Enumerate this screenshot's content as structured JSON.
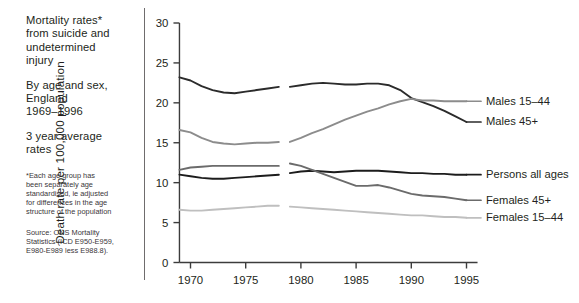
{
  "caption": {
    "title": "Mortality rates*\nfrom suicide and\nundetermined\ninjury",
    "subtitle": "By age and sex,\nEngland\n1969–1996",
    "subtitle2": "3 year average\nrates",
    "note": "*Each age group has\nbeen separately age\nstandardised, ie adjusted\nfor differences in the age\nstructure of the population",
    "source": "Source: ONS Mortality\nStatistics (ICD E950-E959,\nE980-E989 less E988.8)."
  },
  "chart_data": {
    "type": "line",
    "xlabel": "",
    "ylabel": "Death rate per 100,000 population",
    "xlim": [
      1969,
      1996
    ],
    "ylim": [
      0,
      30
    ],
    "yticks": [
      0,
      5,
      10,
      15,
      20,
      25,
      30
    ],
    "xticks": [
      1970,
      1975,
      1980,
      1985,
      1990,
      1995
    ],
    "ytick_labels": [
      "0",
      "5",
      "10",
      "15",
      "20",
      "25",
      "30"
    ],
    "xtick_labels": [
      "1970",
      "1975",
      "1980",
      "1985",
      "1990",
      "1995"
    ],
    "grid": false,
    "legend": "right-of-plot",
    "break_note": "Series are split into two segments with a gap around 1978–1979 (coding change)",
    "series": [
      {
        "name": "Males 45+",
        "color": "#2b2b2b",
        "label_y": 17.6,
        "segment1": {
          "x": [
            1969,
            1970,
            1971,
            1972,
            1973,
            1974,
            1975,
            1976,
            1977,
            1978
          ],
          "y": [
            23.2,
            22.8,
            22.1,
            21.6,
            21.3,
            21.2,
            21.4,
            21.6,
            21.8,
            22.0
          ]
        },
        "segment2": {
          "x": [
            1979,
            1980,
            1981,
            1982,
            1983,
            1984,
            1985,
            1986,
            1987,
            1988,
            1989,
            1990,
            1991,
            1992,
            1993,
            1994,
            1995
          ],
          "y": [
            22.0,
            22.2,
            22.4,
            22.5,
            22.4,
            22.3,
            22.3,
            22.4,
            22.4,
            22.2,
            21.6,
            20.6,
            20.1,
            19.6,
            19.0,
            18.3,
            17.6
          ]
        }
      },
      {
        "name": "Males 15–44",
        "color": "#8c8c8c",
        "label_y": 20.2,
        "segment1": {
          "x": [
            1969,
            1970,
            1971,
            1972,
            1973,
            1974,
            1975,
            1976,
            1977,
            1978
          ],
          "y": [
            16.6,
            16.3,
            15.6,
            15.1,
            14.9,
            14.8,
            14.9,
            15.0,
            15.0,
            15.1
          ]
        },
        "segment2": {
          "x": [
            1979,
            1980,
            1981,
            1982,
            1983,
            1984,
            1985,
            1986,
            1987,
            1988,
            1989,
            1990,
            1991,
            1992,
            1993,
            1994,
            1995
          ],
          "y": [
            15.1,
            15.6,
            16.2,
            16.7,
            17.3,
            17.9,
            18.4,
            18.9,
            19.3,
            19.8,
            20.2,
            20.5,
            20.3,
            20.3,
            20.2,
            20.2,
            20.2
          ]
        }
      },
      {
        "name": "Persons all ages",
        "color": "#1c1c1c",
        "label_y": 11.0,
        "segment1": {
          "x": [
            1969,
            1970,
            1971,
            1972,
            1973,
            1974,
            1975,
            1976,
            1977,
            1978
          ],
          "y": [
            11.0,
            10.8,
            10.6,
            10.5,
            10.5,
            10.6,
            10.7,
            10.8,
            10.9,
            11.0
          ]
        },
        "segment2": {
          "x": [
            1979,
            1980,
            1981,
            1982,
            1983,
            1984,
            1985,
            1986,
            1987,
            1988,
            1989,
            1990,
            1991,
            1992,
            1993,
            1994,
            1995
          ],
          "y": [
            11.2,
            11.4,
            11.5,
            11.4,
            11.3,
            11.4,
            11.5,
            11.5,
            11.5,
            11.4,
            11.3,
            11.2,
            11.2,
            11.1,
            11.1,
            11.0,
            11.0
          ]
        }
      },
      {
        "name": "Females 45+",
        "color": "#6b6b6b",
        "label_y": 7.8,
        "segment1": {
          "x": [
            1969,
            1970,
            1971,
            1972,
            1973,
            1974,
            1975,
            1976,
            1977,
            1978
          ],
          "y": [
            11.6,
            11.9,
            12.0,
            12.1,
            12.1,
            12.1,
            12.1,
            12.1,
            12.1,
            12.1
          ]
        },
        "segment2": {
          "x": [
            1979,
            1980,
            1981,
            1982,
            1983,
            1984,
            1985,
            1986,
            1987,
            1988,
            1989,
            1990,
            1991,
            1992,
            1993,
            1994,
            1995
          ],
          "y": [
            12.4,
            12.1,
            11.6,
            11.1,
            10.6,
            10.1,
            9.6,
            9.6,
            9.7,
            9.4,
            9.0,
            8.6,
            8.4,
            8.3,
            8.2,
            8.0,
            7.8
          ]
        }
      },
      {
        "name": "Females 15–44",
        "color": "#bfbfbf",
        "label_y": 5.6,
        "segment1": {
          "x": [
            1969,
            1970,
            1971,
            1972,
            1973,
            1974,
            1975,
            1976,
            1977,
            1978
          ],
          "y": [
            6.6,
            6.5,
            6.5,
            6.6,
            6.7,
            6.8,
            6.9,
            7.0,
            7.1,
            7.1
          ]
        },
        "segment2": {
          "x": [
            1979,
            1980,
            1981,
            1982,
            1983,
            1984,
            1985,
            1986,
            1987,
            1988,
            1989,
            1990,
            1991,
            1992,
            1993,
            1994,
            1995
          ],
          "y": [
            7.0,
            6.9,
            6.8,
            6.7,
            6.6,
            6.5,
            6.4,
            6.3,
            6.2,
            6.1,
            6.0,
            5.9,
            5.9,
            5.8,
            5.7,
            5.7,
            5.6
          ]
        }
      }
    ]
  }
}
